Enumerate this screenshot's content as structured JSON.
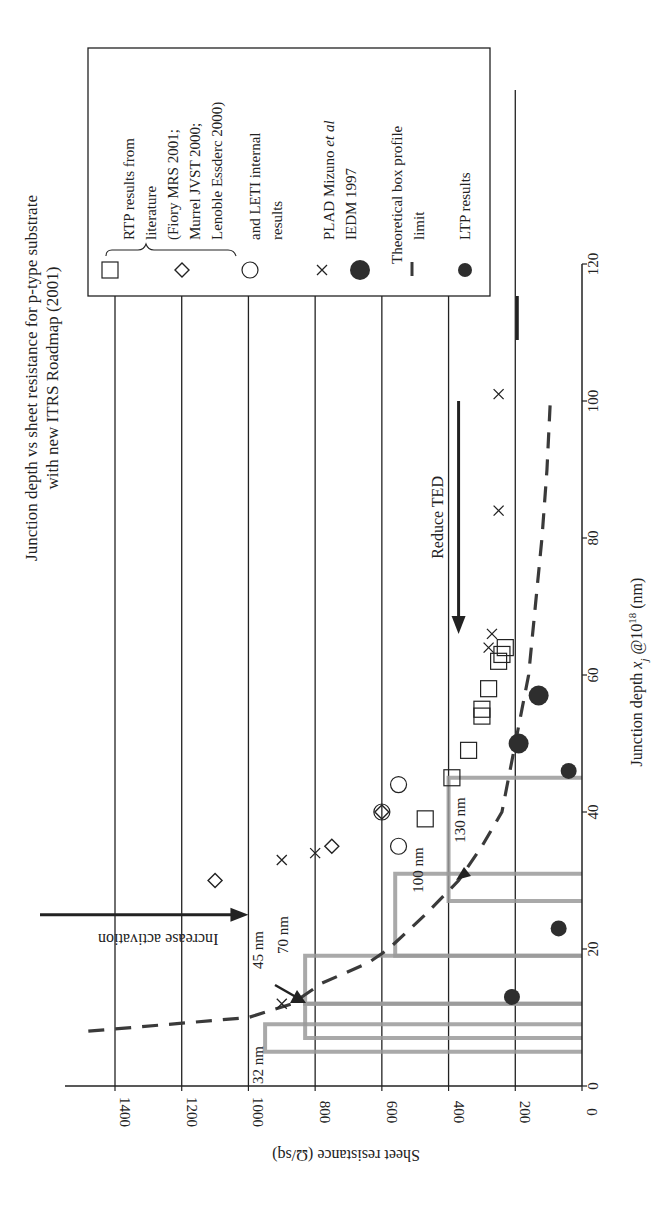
{
  "chart_data": {
    "type": "scatter",
    "orientation": "rotated 90deg clockwise",
    "title_lines": [
      "Junction depth vs sheet resistance for p-type substrate",
      "with new ITRS Roadmap (2001)"
    ],
    "xlabel": "Junction depth x_j @10^18 (nm)",
    "xlabel_parts": {
      "main": "Junction depth ",
      "var": "x",
      "sub": "j",
      "mid": " @10",
      "sup": "18",
      "unit": " (nm)"
    },
    "ylabel": "Sheet resistance (Ω/sq)",
    "xlim": [
      0,
      120
    ],
    "ylim": [
      0,
      1400
    ],
    "xticks": [
      0,
      20,
      40,
      60,
      80,
      100,
      120
    ],
    "yticks": [
      0,
      200,
      400,
      600,
      800,
      1000,
      1200,
      1400
    ],
    "grid": "horizontal gridlines at each y tick (200..1400)",
    "legend_position": "upper right (in rotated frame: top of image)",
    "series": [
      {
        "name": "RTP results from literature (squares)",
        "marker": "square",
        "points": [
          [
            39,
            470
          ],
          [
            45,
            390
          ],
          [
            49,
            340
          ],
          [
            54,
            300
          ],
          [
            55,
            300
          ],
          [
            58,
            280
          ],
          [
            62,
            250
          ],
          [
            63,
            240
          ],
          [
            64,
            230
          ]
        ]
      },
      {
        "name": "(Fiory MRS 2001; Murrel JVST 2000; Lenoble Essderc 2000) (diamonds)",
        "marker": "diamond",
        "points": [
          [
            30,
            1100
          ],
          [
            35,
            750
          ],
          [
            40,
            600
          ]
        ]
      },
      {
        "name": "and LETI internal results (circles)",
        "marker": "circle",
        "points": [
          [
            35,
            550
          ],
          [
            40,
            600
          ],
          [
            44,
            550
          ]
        ]
      },
      {
        "name": "and LETI internal results (crosses)",
        "marker": "cross",
        "points": [
          [
            12,
            900
          ],
          [
            33,
            900
          ],
          [
            34,
            800
          ],
          [
            64,
            280
          ],
          [
            66,
            270
          ],
          [
            84,
            250
          ],
          [
            101,
            250
          ]
        ]
      },
      {
        "name": "PLAD Mizuno et al IEDM 1997",
        "marker": "filled-circle-large",
        "points": [
          [
            50,
            190
          ],
          [
            57,
            130
          ]
        ]
      },
      {
        "name": "Theoretical box profile limit",
        "marker": "dashed-line",
        "points": [
          [
            8,
            1480
          ],
          [
            10,
            1000
          ],
          [
            12,
            870
          ],
          [
            15,
            780
          ],
          [
            18,
            640
          ],
          [
            20,
            580
          ],
          [
            25,
            470
          ],
          [
            30,
            370
          ],
          [
            35,
            300
          ],
          [
            40,
            240
          ],
          [
            45,
            220
          ],
          [
            50,
            200
          ],
          [
            55,
            180
          ],
          [
            60,
            160
          ],
          [
            70,
            140
          ],
          [
            80,
            120
          ],
          [
            90,
            105
          ],
          [
            100,
            95
          ]
        ]
      },
      {
        "name": "LTP results",
        "marker": "filled-circle-small",
        "points": [
          [
            13,
            210
          ],
          [
            23,
            70
          ],
          [
            46,
            40
          ]
        ]
      }
    ],
    "itrs_boxes": [
      {
        "label": "32 nm",
        "xj_min": 5,
        "xj_max": 9,
        "rs_max": 950
      },
      {
        "label": "45 nm",
        "xj_min": 7,
        "xj_max": 12,
        "rs_max": 830
      },
      {
        "label": "70 nm",
        "xj_min": 12,
        "xj_max": 19,
        "rs_max": 830
      },
      {
        "label": "100 nm",
        "xj_min": 19,
        "xj_max": 31,
        "rs_max": 560
      },
      {
        "label": "130 nm",
        "xj_min": 27,
        "xj_max": 45,
        "rs_max": 400
      }
    ],
    "annotations": [
      {
        "text": "Increase activation",
        "arrow": "toward lower sheet resistance",
        "at_xj": 25,
        "from_rs": 1520,
        "to_rs": 1000
      },
      {
        "text": "Reduce TED",
        "arrow": "toward smaller junction depth",
        "at_rs": 370,
        "from_xj": 100,
        "to_xj": 66
      }
    ]
  },
  "legend": {
    "items": [
      {
        "marker": "square",
        "lines": [
          "RTP results from",
          "literature"
        ]
      },
      {
        "marker": "diamond",
        "lines": [
          "(Fiory MRS 2001;",
          "Murrel JVST 2000;",
          "Lenoble Essderc 2000)"
        ]
      },
      {
        "marker": "circle",
        "lines": [
          "and LETI  internal",
          "results"
        ]
      },
      {
        "marker": "cross",
        "lines": []
      },
      {
        "marker": "filled-circle-large",
        "lines": [
          "PLAD Mizuno et al",
          "IEDM 1997"
        ],
        "italic": "et al"
      },
      {
        "marker": "dash",
        "lines": [
          "Theoretical box profile",
          "limit"
        ]
      },
      {
        "marker": "filled-circle-small",
        "lines": [
          "LTP results"
        ]
      }
    ],
    "line1_main": "PLAD Mizuno ",
    "line1_italic": "et al",
    "line2": "IEDM 1997"
  },
  "colors": {
    "ink": "#222222",
    "box_outline": "#9a9a9a",
    "dashed_curve": "#3a3a3a",
    "marker_fill": "#2e2e2e"
  }
}
